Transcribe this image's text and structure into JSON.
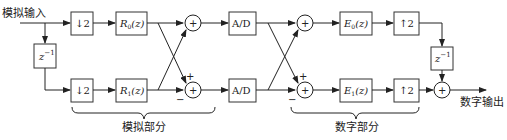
{
  "diagram": {
    "input_label": "模拟输入",
    "output_label": "数字输出",
    "analog_section_label": "模拟部分",
    "digital_section_label": "数字部分",
    "blocks": {
      "down_top": "↓2",
      "down_bottom": "↓2",
      "delay_in": "z",
      "delay_in_exp": "−1",
      "r0_main": "R",
      "r0_sub": "0",
      "r0_arg": "(z)",
      "r1_main": "R",
      "r1_sub": "1",
      "r1_arg": "(z)",
      "ad_top": "A/D",
      "ad_bottom": "A/D",
      "e0_main": "E",
      "e0_sub": "0",
      "e0_arg": "(z)",
      "e1_main": "E",
      "e1_sub": "1",
      "e1_arg": "(z)",
      "up_top": "↑2",
      "up_bottom": "↑2",
      "delay_out": "z",
      "delay_out_exp": "−1"
    },
    "summer_symbol": "+",
    "signs": {
      "plus": "+",
      "minus": "−"
    }
  }
}
